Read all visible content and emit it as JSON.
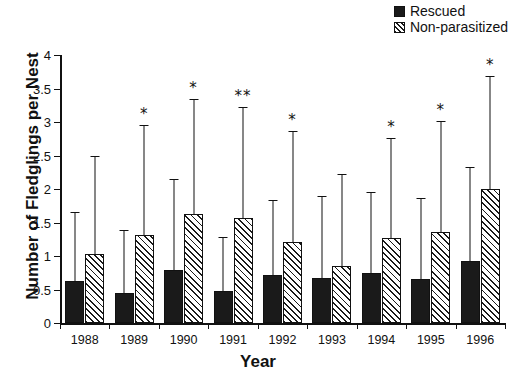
{
  "legend": {
    "position": "top-right",
    "entries": [
      {
        "label": "Rescued",
        "style": "solid",
        "color": "#1a1a1a"
      },
      {
        "label": "Non-parasitized",
        "style": "hatch",
        "color": "#1a1a1a"
      }
    ]
  },
  "axes": {
    "xlabel": "Year",
    "ylabel": "Number of Fledglings per Nest",
    "yticks": [
      "0",
      "0.5",
      "1",
      "1.5",
      "2",
      "2.5",
      "3",
      "3.5",
      "4"
    ],
    "ylim_min": 0,
    "ylim_max": 4
  },
  "chart_data": {
    "type": "bar",
    "title": "",
    "xlabel": "Year",
    "ylabel": "Number of Fledglings per Nest",
    "ylim": [
      0,
      4
    ],
    "ytick_values": [
      0,
      0.5,
      1,
      1.5,
      2,
      2.5,
      3,
      3.5,
      4
    ],
    "grid": false,
    "legend_position": "top-right",
    "error_bar_type": "upper-only",
    "categories": [
      "1988",
      "1989",
      "1990",
      "1991",
      "1992",
      "1993",
      "1994",
      "1995",
      "1996"
    ],
    "series": [
      {
        "name": "Rescued",
        "style": "solid",
        "values": [
          0.62,
          0.45,
          0.79,
          0.48,
          0.71,
          0.67,
          0.75,
          0.65,
          0.92
        ],
        "error_upper": [
          1.65,
          1.39,
          2.15,
          1.28,
          1.84,
          1.9,
          1.96,
          1.87,
          2.33
        ]
      },
      {
        "name": "Non-parasitized",
        "style": "hatch",
        "values": [
          1.03,
          1.31,
          1.63,
          1.56,
          1.21,
          0.85,
          1.27,
          1.36,
          2.0
        ],
        "error_upper": [
          2.5,
          2.95,
          3.35,
          3.22,
          2.86,
          2.22,
          2.76,
          3.02,
          3.68
        ]
      }
    ],
    "annotations": [
      {
        "category": "1988",
        "series": "Non-parasitized",
        "text": ""
      },
      {
        "category": "1989",
        "series": "Non-parasitized",
        "text": "*"
      },
      {
        "category": "1990",
        "series": "Non-parasitized",
        "text": "*"
      },
      {
        "category": "1991",
        "series": "Non-parasitized",
        "text": "**"
      },
      {
        "category": "1992",
        "series": "Non-parasitized",
        "text": "*"
      },
      {
        "category": "1993",
        "series": "Non-parasitized",
        "text": ""
      },
      {
        "category": "1994",
        "series": "Non-parasitized",
        "text": "*"
      },
      {
        "category": "1995",
        "series": "Non-parasitized",
        "text": "*"
      },
      {
        "category": "1996",
        "series": "Non-parasitized",
        "text": "*"
      }
    ]
  }
}
